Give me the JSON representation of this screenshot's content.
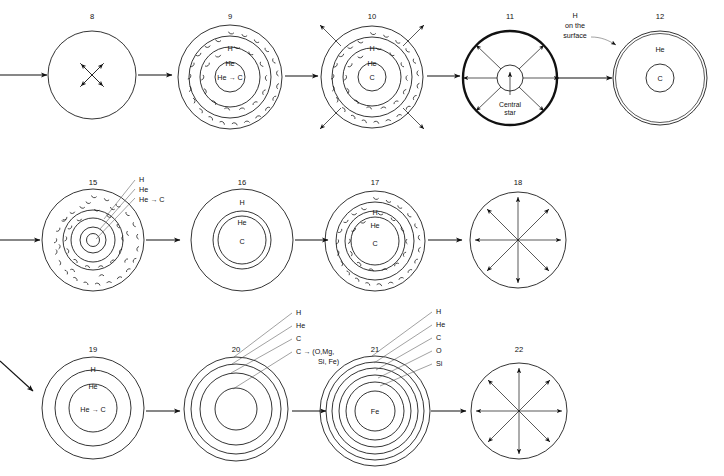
{
  "diagram": {
    "rows": [
      {
        "row_id": "row-top",
        "stages": [
          {
            "number": "8",
            "name": "contracting-protostar",
            "layers": [],
            "core_label": "",
            "annotations": [],
            "arrows": "inward-four",
            "shell_labels": []
          },
          {
            "number": "9",
            "name": "main-sequence-with-convective-envelope",
            "shell_labels": [
              "H",
              "He",
              "He → C"
            ],
            "annotations": [],
            "arrows": "none"
          },
          {
            "number": "10",
            "name": "expanding-envelope-ejection",
            "shell_labels": [
              "H",
              "He",
              "C"
            ],
            "annotations": [],
            "arrows": "outward-four"
          },
          {
            "number": "11",
            "name": "planetary-nebula-with-central-star",
            "shell_labels": [],
            "annotations": [
              "Central",
              "star"
            ],
            "center_caption": "Central star",
            "arrows": "outward-six"
          },
          {
            "number": "12",
            "name": "white-dwarf-carbon-core",
            "shell_labels": [
              "He",
              "C"
            ],
            "annotations": [
              "H",
              "on the",
              "surface"
            ],
            "callout": "H on the surface",
            "arrows": "none"
          }
        ]
      },
      {
        "row_id": "row-middle",
        "stages": [
          {
            "number": "15",
            "name": "red-giant-deep-convection",
            "shell_labels": [],
            "callout_lines": [
              "H",
              "He",
              "He → C"
            ],
            "arrows": "none"
          },
          {
            "number": "16",
            "name": "post-envelope-loss-carbon-core",
            "shell_labels": [
              "H",
              "He",
              "C"
            ],
            "arrows": "none"
          },
          {
            "number": "17",
            "name": "convective-envelope-carbon-core",
            "shell_labels": [
              "H",
              "He",
              "C"
            ],
            "arrows": "none"
          },
          {
            "number": "18",
            "name": "explosion-dispersal",
            "shell_labels": [],
            "arrows": "outward-eight"
          }
        ]
      },
      {
        "row_id": "row-bottom",
        "stages": [
          {
            "number": "19",
            "name": "massive-star-shells",
            "shell_labels": [
              "H",
              "He",
              "He → C"
            ],
            "arrows": "none"
          },
          {
            "number": "20",
            "name": "advanced-burning-shells",
            "callout_lines": [
              "H",
              "He",
              "C",
              "C → (O,Mg,",
              "Si, Fe)"
            ],
            "arrows": "none"
          },
          {
            "number": "21",
            "name": "onion-shell-iron-core",
            "core_label": "Fe",
            "callout_lines": [
              "H",
              "He",
              "C",
              "O",
              "Si"
            ],
            "arrows": "none"
          },
          {
            "number": "22",
            "name": "supernova-explosion",
            "shell_labels": [],
            "arrows": "outward-eight"
          }
        ]
      }
    ],
    "labels": {
      "H": "H",
      "He": "He",
      "C": "C",
      "O": "O",
      "Si": "Si",
      "Fe": "Fe",
      "He_to_C": "He → C",
      "C_to_heavy_line1": "C → (O,Mg,",
      "C_to_heavy_line2": "Si, Fe)",
      "central_star_line1": "Central",
      "central_star_line2": "star",
      "h_surface_line1": "H",
      "h_surface_line2": "on the",
      "h_surface_line3": "surface"
    },
    "numbers": {
      "n8": "8",
      "n9": "9",
      "n10": "10",
      "n11": "11",
      "n12": "12",
      "n15": "15",
      "n16": "16",
      "n17": "17",
      "n18": "18",
      "n19": "19",
      "n20": "20",
      "n21": "21",
      "n22": "22"
    },
    "colors": {
      "ink": "#111111",
      "background": "#ffffff",
      "leader": "#555555"
    }
  }
}
